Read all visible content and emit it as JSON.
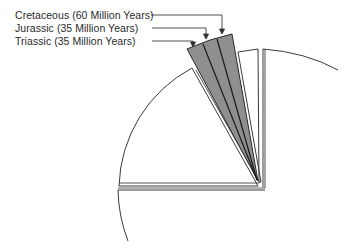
{
  "diagram": {
    "type": "exploded pie / geologic time wedge diagram",
    "labels": [
      {
        "name": "Cretaceous",
        "duration": "60 Million Years",
        "text": "Cretaceous (60 Million Years)"
      },
      {
        "name": "Jurassic",
        "duration": "35 Million Years",
        "text": "Jurassic (35 Million Years)"
      },
      {
        "name": "Triassic",
        "duration": "35 Million Years",
        "text": "Triassic (35 Million Years)"
      }
    ],
    "colors": {
      "stroke": "#3a3a3a",
      "highlight_fill": "#8f8f8f",
      "background": "#ffffff",
      "text": "#2a2a2a"
    }
  }
}
